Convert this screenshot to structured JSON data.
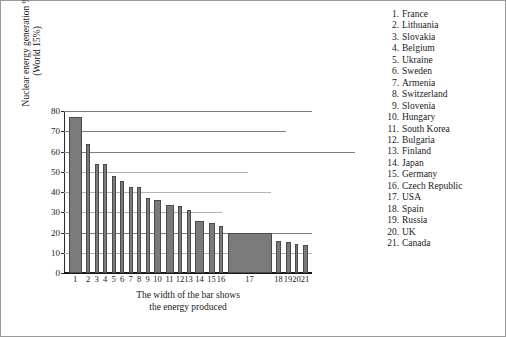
{
  "chart_data": {
    "type": "bar",
    "title": "",
    "subtitle": "",
    "xlabel": "The width of the bar shows\nthe energy produced",
    "ylabel": "Nuclear energy generation %\n(World 15%)",
    "ylim": [
      0,
      80
    ],
    "yticks": [
      0,
      10,
      20,
      30,
      40,
      50,
      60,
      70,
      80
    ],
    "grid": true,
    "legend_position": "right",
    "categories": [
      "1",
      "2",
      "3",
      "4",
      "5",
      "6",
      "7",
      "8",
      "9",
      "10",
      "11",
      "12",
      "13",
      "14",
      "15",
      "16",
      "17",
      "18",
      "19",
      "20",
      "21"
    ],
    "values": [
      77,
      63.5,
      54,
      54,
      48,
      45.5,
      42.5,
      42.5,
      37,
      36,
      33.5,
      33,
      31,
      25.5,
      24.5,
      23,
      20,
      16,
      15.5,
      14.5,
      14
    ],
    "bar_widths": [
      13,
      4,
      4,
      4,
      4,
      4,
      4,
      4,
      4,
      7,
      8,
      4,
      4,
      9,
      6,
      4,
      44,
      5,
      5,
      3,
      5
    ],
    "series": [
      {
        "name": "Nuclear energy generation %",
        "values": [
          77,
          63.5,
          54,
          54,
          48,
          45.5,
          42.5,
          42.5,
          37,
          36,
          33.5,
          33,
          31,
          25.5,
          24.5,
          23,
          20,
          16,
          15.5,
          14.5,
          14
        ]
      }
    ],
    "bar_color": "#7a7a7a",
    "legend_entries": [
      {
        "num": "1.",
        "label": "France",
        "value": 77
      },
      {
        "num": "2.",
        "label": "Lithuania",
        "value": 63.5
      },
      {
        "num": "3.",
        "label": "Slovakia",
        "value": 54
      },
      {
        "num": "4.",
        "label": "Belgium",
        "value": 54
      },
      {
        "num": "5.",
        "label": "Ukraine",
        "value": 48
      },
      {
        "num": "6.",
        "label": "Sweden",
        "value": 45.5
      },
      {
        "num": "7.",
        "label": "Armenia",
        "value": 42.5
      },
      {
        "num": "8.",
        "label": "Switzerland",
        "value": 42.5
      },
      {
        "num": "9.",
        "label": "Slovenia",
        "value": 37
      },
      {
        "num": "10.",
        "label": "Hungary",
        "value": 36
      },
      {
        "num": "11.",
        "label": "South Korea",
        "value": 33.5
      },
      {
        "num": "12.",
        "label": "Bulgaria",
        "value": 33
      },
      {
        "num": "13.",
        "label": "Finland",
        "value": 31
      },
      {
        "num": "14.",
        "label": "Japan",
        "value": 25.5
      },
      {
        "num": "15.",
        "label": "Germany",
        "value": 24.5
      },
      {
        "num": "16.",
        "label": "Czech Republic",
        "value": 23
      },
      {
        "num": "17.",
        "label": "USA",
        "value": 20
      },
      {
        "num": "18.",
        "label": "Spain",
        "value": 16
      },
      {
        "num": "19.",
        "label": "Russia",
        "value": 15.5
      },
      {
        "num": "20.",
        "label": "UK",
        "value": 14.5
      },
      {
        "num": "21.",
        "label": "Canada",
        "value": 14
      }
    ]
  },
  "axis": {
    "y_ticks": [
      "80",
      "70",
      "60",
      "50",
      "40",
      "30",
      "20",
      "10",
      "0"
    ],
    "x_ticks": [
      "1",
      "2",
      "3",
      "4",
      "5",
      "6",
      "7",
      "8",
      "9",
      "10",
      "11",
      "12",
      "13",
      "14",
      "15",
      "16",
      "17",
      "18",
      "19",
      "20",
      "21"
    ],
    "y_title": "Nuclear energy generation %\n(World 15%)",
    "x_caption": "The width of the bar shows\nthe energy produced"
  }
}
